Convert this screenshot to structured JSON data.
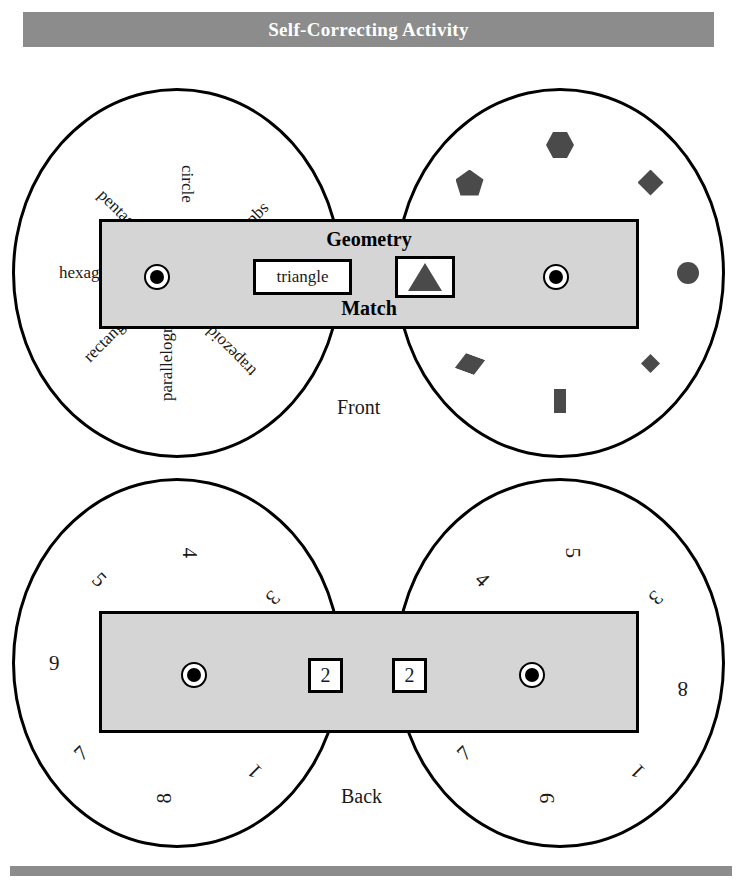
{
  "header": {
    "title": "Self-Correcting Activity"
  },
  "front": {
    "face_label": "Front",
    "strip": {
      "title": "Geometry",
      "subtitle": "Match",
      "word_window": "triangle",
      "shape_window_icon": "triangle-icon",
      "left_rivet": "rivet-icon",
      "right_rivet": "rivet-icon"
    },
    "left_wheel": {
      "name": "shape-name-wheel",
      "labels": [
        {
          "text": "circle",
          "angle": -90
        },
        {
          "text": "square",
          "angle": -45
        },
        {
          "text": "trapezoid",
          "angle": 45
        },
        {
          "text": "parallelogram",
          "angle": 90
        },
        {
          "text": "rectangle",
          "angle": 135
        },
        {
          "text": "hexagon",
          "angle": 180
        },
        {
          "text": "pentagon",
          "angle": -135
        }
      ]
    },
    "right_wheel": {
      "name": "shape-picture-wheel",
      "shapes": [
        {
          "icon": "hexagon-icon",
          "angle": -90
        },
        {
          "icon": "diamond-icon",
          "angle": -45
        },
        {
          "icon": "circle-icon",
          "angle": 0
        },
        {
          "icon": "small-diamond-icon",
          "angle": 45
        },
        {
          "icon": "rectangle-icon",
          "angle": 90
        },
        {
          "icon": "parallelogram-icon",
          "angle": 135
        },
        {
          "icon": "pentagon-icon",
          "angle": -135
        }
      ]
    }
  },
  "back": {
    "face_label": "Back",
    "strip": {
      "left_window": "2",
      "right_window": "2",
      "left_rivet": "rivet-icon",
      "right_rivet": "rivet-icon"
    },
    "left_wheel": {
      "name": "back-left-number-wheel",
      "numbers": [
        {
          "text": "4",
          "angle": -90
        },
        {
          "text": "3",
          "angle": -45
        },
        {
          "text": "1",
          "angle": 45
        },
        {
          "text": "8",
          "angle": 90
        },
        {
          "text": "7",
          "angle": 135
        },
        {
          "text": "9",
          "angle": 180
        },
        {
          "text": "5",
          "angle": -135
        }
      ]
    },
    "right_wheel": {
      "name": "back-right-number-wheel",
      "numbers": [
        {
          "text": "5",
          "angle": -90
        },
        {
          "text": "3",
          "angle": -45
        },
        {
          "text": "8",
          "angle": 0
        },
        {
          "text": "1",
          "angle": 45
        },
        {
          "text": "9",
          "angle": 90
        },
        {
          "text": "7",
          "angle": 135
        },
        {
          "text": "4",
          "angle": -135
        }
      ]
    }
  },
  "colors": {
    "bar": "#8c8c8c",
    "strip_fill": "#d5d5d5",
    "shape_fill": "#4a4a4a",
    "ink": "#000000",
    "paper": "#ffffff"
  }
}
